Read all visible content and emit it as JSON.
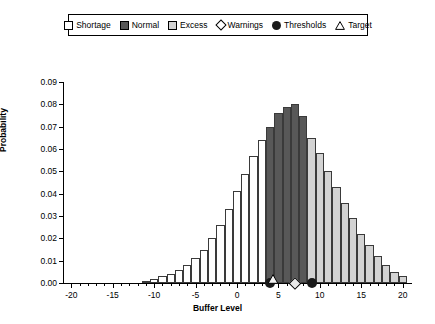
{
  "legend": {
    "items": [
      {
        "label": "Shortage",
        "marker": "square-white",
        "color": "#ffffff"
      },
      {
        "label": "Normal",
        "marker": "square-dark",
        "color": "#585858"
      },
      {
        "label": "Excess",
        "marker": "square-lightgray",
        "color": "#d3d3d3"
      },
      {
        "label": "Warnings",
        "marker": "diamond-open",
        "color": "#ffffff"
      },
      {
        "label": "Thresholds",
        "marker": "circle-filled",
        "color": "#1a1a1a"
      },
      {
        "label": "Target",
        "marker": "triangle-open",
        "color": "#ffffff"
      }
    ]
  },
  "chart_data": {
    "type": "bar",
    "title": "",
    "xlabel": "Buffer Level",
    "ylabel": "Probability",
    "xlim": [
      -21,
      21
    ],
    "ylim": [
      0.0,
      0.09
    ],
    "grid": false,
    "legend_position": "top-center",
    "xticks": [
      -20,
      -15,
      -10,
      -5,
      0,
      5,
      10,
      15,
      20
    ],
    "xtick_step_minor": 1,
    "yticks": [
      "0.00",
      "0.01",
      "0.02",
      "0.03",
      "0.04",
      "0.05",
      "0.06",
      "0.07",
      "0.08",
      "0.09"
    ],
    "categories": [
      -20,
      -19,
      -18,
      -17,
      -16,
      -15,
      -14,
      -13,
      -12,
      -11,
      -10,
      -9,
      -8,
      -7,
      -6,
      -5,
      -4,
      -3,
      -2,
      -1,
      0,
      1,
      2,
      3,
      4,
      5,
      6,
      7,
      8,
      9,
      10,
      11,
      12,
      13,
      14,
      15,
      16,
      17,
      18,
      19,
      20
    ],
    "values": [
      0.0,
      0.0,
      0.0,
      0.0,
      0.0,
      0.0,
      0.0,
      0.0,
      0.0,
      0.001,
      0.002,
      0.003,
      0.004,
      0.006,
      0.008,
      0.011,
      0.015,
      0.02,
      0.026,
      0.033,
      0.041,
      0.049,
      0.057,
      0.064,
      0.07,
      0.076,
      0.079,
      0.08,
      0.075,
      0.065,
      0.058,
      0.05,
      0.043,
      0.036,
      0.029,
      0.022,
      0.017,
      0.012,
      0.008,
      0.005,
      0.003
    ],
    "bar_classes": [
      "shortage",
      "shortage",
      "shortage",
      "shortage",
      "shortage",
      "shortage",
      "shortage",
      "shortage",
      "shortage",
      "shortage",
      "shortage",
      "shortage",
      "shortage",
      "shortage",
      "shortage",
      "shortage",
      "shortage",
      "shortage",
      "shortage",
      "shortage",
      "shortage",
      "shortage",
      "shortage",
      "shortage",
      "normal",
      "normal",
      "normal",
      "normal",
      "normal",
      "excess",
      "excess",
      "excess",
      "excess",
      "excess",
      "excess",
      "excess",
      "excess",
      "excess",
      "excess",
      "excess",
      "excess"
    ],
    "class_colors": {
      "shortage": "#ffffff",
      "normal": "#585858",
      "excess": "#d3d3d3"
    },
    "annotations": [
      {
        "name": "threshold-low",
        "type": "circle-filled",
        "x": 4,
        "y": 0.0
      },
      {
        "name": "target",
        "type": "triangle-open",
        "x": 4.3,
        "y": 0.0
      },
      {
        "name": "warning",
        "type": "diamond-open",
        "x": 7,
        "y": 0.0
      },
      {
        "name": "threshold-high",
        "type": "circle-filled",
        "x": 9,
        "y": 0.0
      }
    ]
  }
}
